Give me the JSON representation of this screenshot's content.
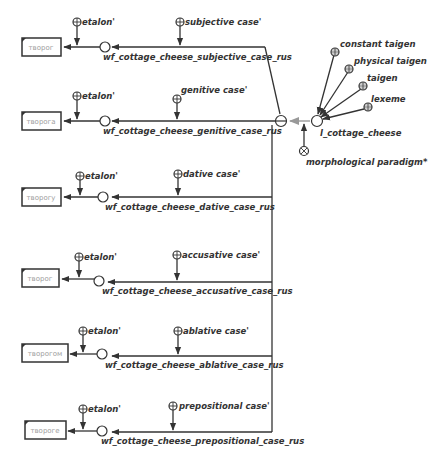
{
  "diagram": {
    "lexeme_node": {
      "label": "l_cottage_cheese",
      "attributes": [
        {
          "label": "constant taigen",
          "icon": "circle-grid-icon"
        },
        {
          "label": "physical taigen",
          "icon": "circle-grid-icon"
        },
        {
          "label": "taigen",
          "icon": "circle-grid-icon"
        },
        {
          "label": "lexeme",
          "icon": "circle-grid-icon"
        }
      ],
      "paradigm": {
        "label": "morphological paradigm*",
        "icon": "circle-x-icon"
      }
    },
    "branches": [
      {
        "wordform": "творог",
        "etalon": "etalon'",
        "case": "subjective case'",
        "relation": "wf_cottage_cheese_subjective_case_rus"
      },
      {
        "wordform": "творога",
        "etalon": "etalon'",
        "case": "genitive case'",
        "relation": "wf_cottage_cheese_genitive_case_rus"
      },
      {
        "wordform": "творогу",
        "etalon": "etalon'",
        "case": "dative case'",
        "relation": "wf_cottage_cheese_dative_case_rus"
      },
      {
        "wordform": "творог",
        "etalon": "etalon'",
        "case": "accusative case'",
        "relation": "wf_cottage_cheese_accusative_case_rus"
      },
      {
        "wordform": "творогом",
        "etalon": "etalon'",
        "case": "ablative case'",
        "relation": "wf_cottage_cheese_ablative_case_rus"
      },
      {
        "wordform": "твороге",
        "etalon": "etalon'",
        "case": "prepositional case'",
        "relation": "wf_cottage_cheese_prepositional_case_rus"
      }
    ],
    "colors": {
      "line": "#333333",
      "label": "#333333",
      "box_text": "#a0a0a0",
      "light_arc": "#b8b8b8"
    }
  }
}
